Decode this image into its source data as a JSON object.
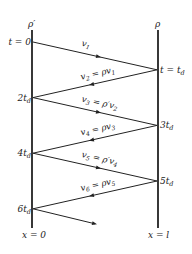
{
  "diagram": {
    "left_boundary": {
      "reflection_coefficient": "ρ′",
      "position_label": "x = 0"
    },
    "right_boundary": {
      "reflection_coefficient": "ρ",
      "position_label": "x = l"
    },
    "time_labels": [
      {
        "side": "left",
        "text": "t = 0"
      },
      {
        "side": "right",
        "text": "t = t",
        "sub": "d"
      },
      {
        "side": "left",
        "text": "2t",
        "sub": "d"
      },
      {
        "side": "right",
        "text": "3t",
        "sub": "d"
      },
      {
        "side": "left",
        "text": "4t",
        "sub": "d"
      },
      {
        "side": "right",
        "text": "5t",
        "sub": "d"
      },
      {
        "side": "left",
        "text": "6t",
        "sub": "d"
      }
    ],
    "waves": [
      {
        "name": "v",
        "sub": "1",
        "eq": ""
      },
      {
        "name": "v",
        "sub": "2",
        "eq": " = ρv",
        "eq_sub": "1"
      },
      {
        "name": "v",
        "sub": "3",
        "eq": " = ρ′v",
        "eq_sub": "2"
      },
      {
        "name": "v",
        "sub": "4",
        "eq": " = ρv",
        "eq_sub": "3"
      },
      {
        "name": "v",
        "sub": "5",
        "eq": " = ρ′v",
        "eq_sub": "4"
      },
      {
        "name": "v",
        "sub": "6",
        "eq": " = ρv",
        "eq_sub": "5"
      }
    ]
  }
}
